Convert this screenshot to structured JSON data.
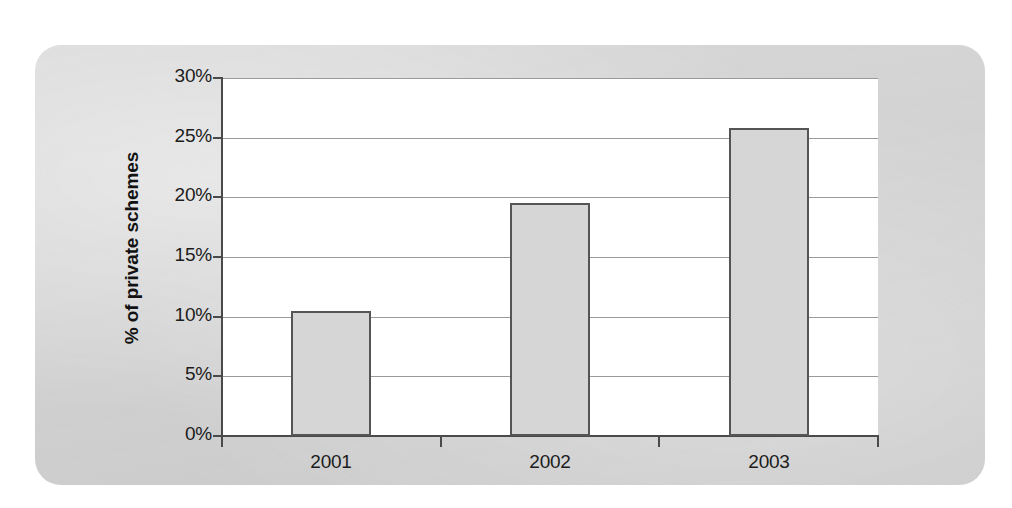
{
  "chart_data": {
    "type": "bar",
    "title": "",
    "xlabel": "",
    "ylabel": "% of private schemes",
    "categories": [
      "2001",
      "2002",
      "2003"
    ],
    "values": [
      10.5,
      19.5,
      25.8
    ],
    "series": [
      {
        "name": "% of private schemes",
        "values": [
          10.5,
          19.5,
          25.8
        ]
      }
    ],
    "ylim": [
      0,
      30
    ],
    "yticks": [
      0,
      5,
      10,
      15,
      20,
      25,
      30
    ],
    "ytick_labels": [
      "0%",
      "5%",
      "10%",
      "15%",
      "20%",
      "25%",
      "30%"
    ],
    "xtick_labels": [
      "2001",
      "2002",
      "2003"
    ],
    "grid": "horizontal",
    "legend": "none",
    "bar_fill_color": "#d6d6d6",
    "bar_edge_color": "#555555",
    "gridline_color": "#9a9a9a",
    "axis_color": "#4a4a4a",
    "plot_background_color": "#ffffff",
    "panel_background_color": "#d4d4d4"
  }
}
